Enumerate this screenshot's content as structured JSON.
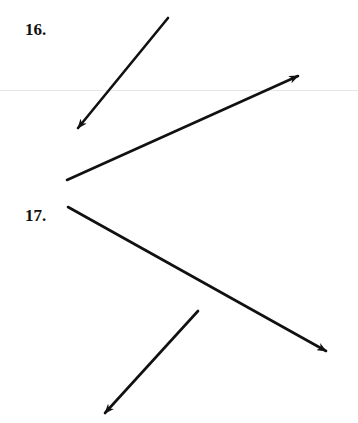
{
  "problems": [
    {
      "number": "16.",
      "vectors": [
        {
          "from": [
            168,
            18
          ],
          "to": [
            78,
            128
          ]
        },
        {
          "from": [
            67,
            180
          ],
          "to": [
            298,
            76
          ]
        }
      ]
    },
    {
      "number": "17.",
      "vectors": [
        {
          "from": [
            68,
            207
          ],
          "to": [
            326,
            351
          ]
        },
        {
          "from": [
            198,
            311
          ],
          "to": [
            105,
            413
          ]
        }
      ]
    }
  ],
  "colors": {
    "ink": "#111111",
    "rule": "#e6e6e6"
  }
}
